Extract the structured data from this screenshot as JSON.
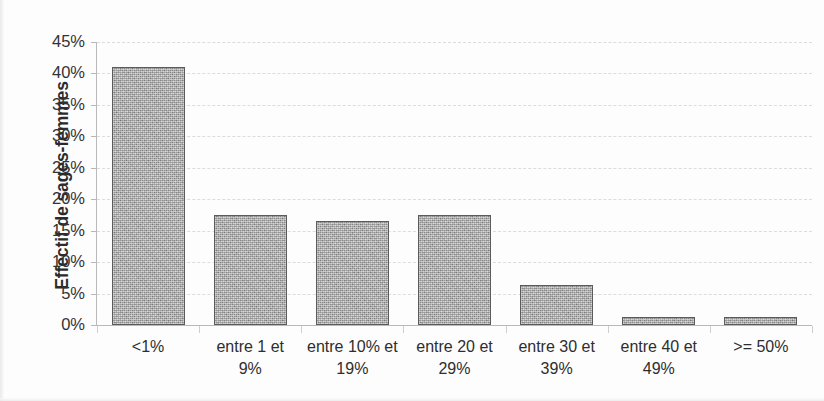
{
  "chart_data": {
    "type": "bar",
    "title": "",
    "xlabel": "",
    "ylabel": "Effectif de sages-femmes",
    "categories": [
      "<1%",
      "entre 1 et 9%",
      "entre 10% et 19%",
      "entre 20 et 29%",
      "entre 30 et 39%",
      "entre 40 et 49%",
      ">= 50%"
    ],
    "category_lines": [
      [
        "<1%"
      ],
      [
        "entre 1 et",
        "9%"
      ],
      [
        "entre 10% et",
        "19%"
      ],
      [
        "entre 20 et",
        "29%"
      ],
      [
        "entre 30 et",
        "39%"
      ],
      [
        "entre 40 et",
        "49%"
      ],
      [
        ">= 50%"
      ]
    ],
    "values": [
      41,
      17.5,
      16.5,
      17.5,
      6.3,
      1.2,
      1.2
    ],
    "ylim": [
      0,
      45
    ],
    "ytick_values": [
      0,
      5,
      10,
      15,
      20,
      25,
      30,
      35,
      40,
      45
    ],
    "ytick_labels": [
      "0%",
      "5%",
      "10%",
      "15%",
      "20%",
      "25%",
      "30%",
      "35%",
      "40%",
      "45%"
    ],
    "grid": true,
    "grid_style": "dashed",
    "legend": null,
    "series": [
      {
        "name": "Effectif de sages-femmes",
        "values": [
          41,
          17.5,
          16.5,
          17.5,
          6.3,
          1.2,
          1.2
        ]
      }
    ],
    "colors": {
      "bar_fill": "#a9a9a9",
      "bar_border": "#5b5b5b",
      "gridline": "#dcdcdc",
      "axis": "#b9b9b9",
      "text": "#2e2e2e",
      "background": "#fdfdfd"
    }
  }
}
